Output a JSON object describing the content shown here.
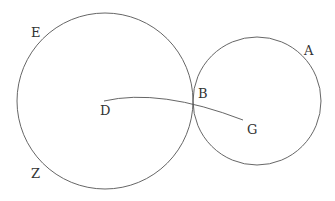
{
  "diagram": {
    "stroke_color": "#555555",
    "labels": {
      "E": "E",
      "Z": "Z",
      "D": "D",
      "B": "B",
      "G": "G",
      "A": "A"
    },
    "circles": [
      {
        "name": "circle-DEZ",
        "cx": 105,
        "cy": 101,
        "r": 88
      },
      {
        "name": "circle-GA",
        "cx": 257,
        "cy": 101,
        "r": 64
      }
    ]
  }
}
